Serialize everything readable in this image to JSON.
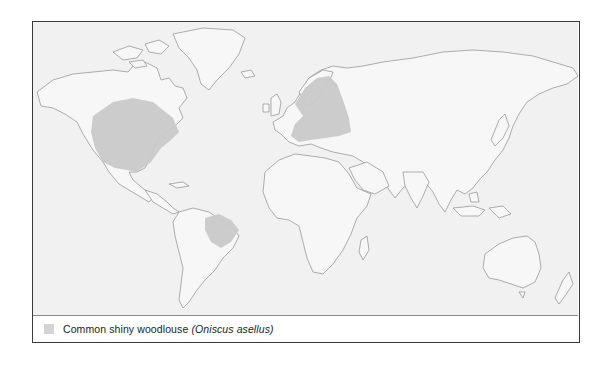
{
  "map": {
    "type": "world distribution map",
    "background_color": "#f1f1f1",
    "land_color": "#f7f7f7",
    "coastline_color": "#8c8c8c",
    "range_color": "#c9c9c9",
    "ranges": [
      {
        "region": "North America (USA and southern Canada)"
      },
      {
        "region": "Europe (incl. British Isles, Scandinavia)"
      },
      {
        "region": "North-eastern Brazil"
      }
    ]
  },
  "legend": {
    "swatch_color": "#d4d4d4",
    "common_name": "Common shiny woodlouse",
    "scientific_name": "(Oniscus asellus)"
  }
}
